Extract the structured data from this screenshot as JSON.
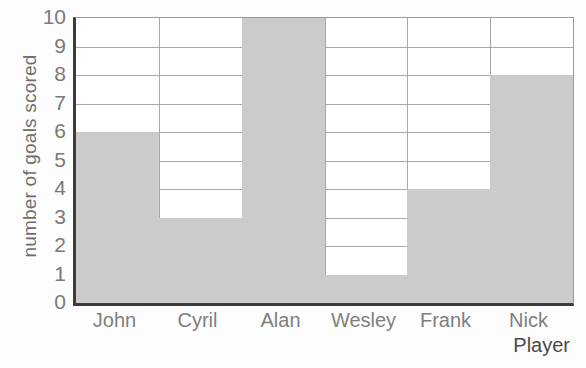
{
  "chart_data": {
    "type": "bar",
    "title": "",
    "subtitle": "",
    "categories": [
      "John",
      "Cyril",
      "Alan",
      "Wesley",
      "Frank",
      "Nick"
    ],
    "values": [
      6,
      3,
      10,
      1,
      4,
      8
    ],
    "series": [
      {
        "name": "number of goals scored",
        "values": [
          6,
          3,
          10,
          1,
          4,
          8
        ]
      }
    ],
    "xlabel": "Player",
    "ylabel": "number of goals scored",
    "ylim": [
      0,
      10
    ],
    "ytick_labels": [
      "0",
      "1",
      "2",
      "3",
      "4",
      "5",
      "6",
      "7",
      "8",
      "9",
      "10"
    ],
    "ytick_values": [
      0,
      1,
      2,
      3,
      4,
      5,
      6,
      7,
      8,
      9,
      10
    ],
    "grid": true,
    "legend": "none",
    "legend_position": "none",
    "annotations": [],
    "bar_color": "#cbcbcb",
    "gridline_color": "#a8a8a8",
    "axis_color": "#3c3c3c",
    "plot_background": "#ffffff",
    "figure_background": "#fdfdfd"
  }
}
